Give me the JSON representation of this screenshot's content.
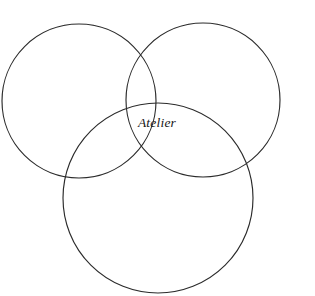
{
  "figure": {
    "type": "venn-diagram",
    "title": "",
    "width": 315,
    "height": 296,
    "background_color": "#ffffff",
    "stroke_color": "#2b2b2b",
    "stroke_width": 1.15
  },
  "circles": [
    {
      "name": "top-left-circle",
      "label": "",
      "cx": 79,
      "cy": 101,
      "r": 77
    },
    {
      "name": "top-right-circle",
      "label": "",
      "cx": 203,
      "cy": 100,
      "r": 77
    },
    {
      "name": "bottom-circle",
      "label": "",
      "cx": 158,
      "cy": 198,
      "r": 95
    }
  ],
  "labels": [
    {
      "name": "center-intersection-label",
      "text": "Atelier",
      "x": 157,
      "y": 127,
      "font_style": "italic",
      "font_size": 13.5,
      "color": "#171717"
    }
  ]
}
